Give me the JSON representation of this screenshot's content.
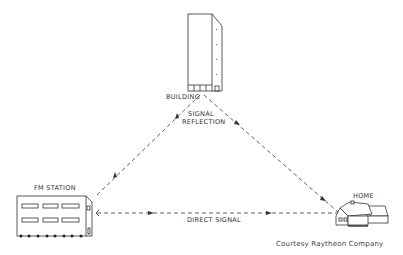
{
  "diagram": {
    "nodes": {
      "building": {
        "label": "BUILDING"
      },
      "fm_station": {
        "label": "FM STATION"
      },
      "home": {
        "label": "HOME"
      }
    },
    "edges": {
      "reflection": {
        "label_line1": "SIGNAL",
        "label_line2": "REFLECTION"
      },
      "direct": {
        "label": "DIRECT SIGNAL"
      }
    },
    "credit": "Courtesy  Raytheon  Company",
    "colors": {
      "line": "#333333",
      "background": "#ffffff"
    }
  }
}
